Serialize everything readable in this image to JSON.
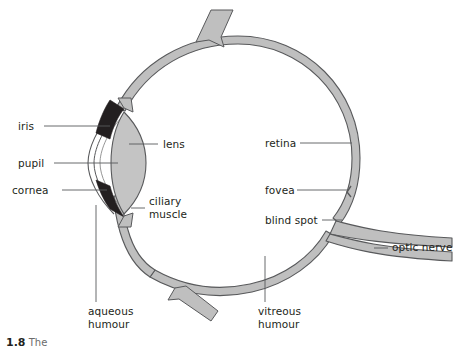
{
  "figure": {
    "caption_number": "1.8",
    "caption_text": "The",
    "colors": {
      "sclera_fill": "#bfbfbf",
      "sclera_stroke": "#58595b",
      "lens_fill": "#c4c4c4",
      "iris_fill": "#231f20",
      "leader_line": "#58595b",
      "text": "#231f20",
      "background": "#ffffff"
    }
  },
  "labels": {
    "iris": "iris",
    "pupil": "pupil",
    "cornea": "cornea",
    "lens": "lens",
    "ciliary_muscle_line1": "ciliary",
    "ciliary_muscle_line2": "muscle",
    "retina": "retina",
    "fovea": "fovea",
    "blind_spot": "blind spot",
    "optic_nerve": "optic nerve",
    "aqueous_humour_line1": "aqueous",
    "aqueous_humour_line2": "humour",
    "vitreous_humour_line1": "vitreous",
    "vitreous_humour_line2": "humour"
  }
}
